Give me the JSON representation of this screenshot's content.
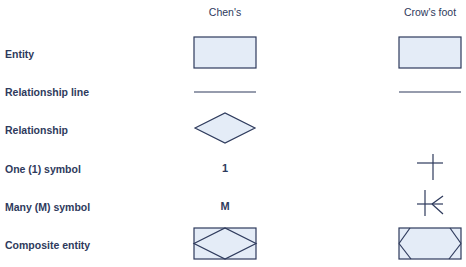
{
  "columns": {
    "chen": "Chen's",
    "crows_foot": "Crow's foot"
  },
  "rows": [
    {
      "label": "Entity",
      "chen": "rectangle",
      "crows_foot": "rectangle"
    },
    {
      "label": "Relationship line",
      "chen": "line",
      "crows_foot": "line"
    },
    {
      "label": "Relationship",
      "chen": "diamond",
      "crows_foot": ""
    },
    {
      "label": "One (1) symbol",
      "chen": "1",
      "crows_foot": "bar-cross"
    },
    {
      "label": "Many (M) symbol",
      "chen": "M",
      "crows_foot": "crows-foot"
    },
    {
      "label": "Composite entity",
      "chen": "rectangle-with-diamond",
      "crows_foot": "rectangle-with-cut-corners"
    }
  ],
  "colors": {
    "stroke": "#2e3a5c",
    "fill": "#e4ecf7",
    "text": "#2e3a5c",
    "background": "#ffffff"
  }
}
